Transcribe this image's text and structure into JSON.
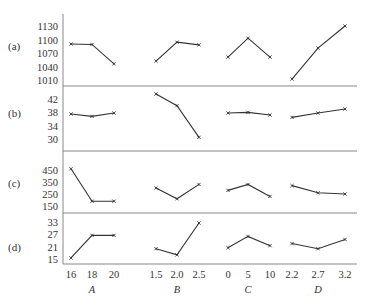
{
  "chart_data": {
    "type": "line",
    "title": "",
    "layout": {
      "panels_stacked_vertically": 4,
      "factor_groups_per_panel": 4,
      "grid": false,
      "legend": "none",
      "marker": "x-cross",
      "line_color": "#333333",
      "axis_color": "#888888"
    },
    "factors": [
      {
        "name": "A",
        "levels": [
          "16",
          "18",
          "20"
        ]
      },
      {
        "name": "B",
        "levels": [
          "1.5",
          "2.0",
          "2.5"
        ]
      },
      {
        "name": "C",
        "levels": [
          "0",
          "5",
          "10"
        ]
      },
      {
        "name": "D",
        "levels": [
          "2.2",
          "2.7",
          "3.2"
        ]
      }
    ],
    "panels": [
      {
        "label": "(a)",
        "yticks": [
          "1130",
          "1100",
          "1070",
          "1040",
          "1010"
        ],
        "ylim": [
          995,
          1145
        ],
        "series": [
          {
            "factor": "A",
            "values": [
              1090,
              1089,
              1046
            ]
          },
          {
            "factor": "B",
            "values": [
              1052,
              1094,
              1088
            ]
          },
          {
            "factor": "C",
            "values": [
              1061,
              1103,
              1061
            ]
          },
          {
            "factor": "D",
            "values": [
              1012,
              1081,
              1130
            ]
          }
        ]
      },
      {
        "label": "(b)",
        "yticks": [
          "42",
          "38",
          "34",
          "30"
        ],
        "ylim": [
          26.5,
          46
        ],
        "series": [
          {
            "factor": "A",
            "values": [
              37.5,
              36.8,
              37.8
            ]
          },
          {
            "factor": "B",
            "values": [
              43.5,
              40.0,
              30.5
            ]
          },
          {
            "factor": "C",
            "values": [
              37.8,
              38.0,
              37.2
            ]
          },
          {
            "factor": "D",
            "values": [
              36.5,
              37.8,
              39.0
            ]
          }
        ]
      },
      {
        "label": "(c)",
        "yticks": [
          "450",
          "350",
          "250",
          "150"
        ],
        "ylim": [
          95,
          580
        ],
        "series": [
          {
            "factor": "A",
            "values": [
              460,
              190,
              190
            ]
          },
          {
            "factor": "B",
            "values": [
              300,
              210,
              330
            ]
          },
          {
            "factor": "C",
            "values": [
              280,
              330,
              230
            ]
          },
          {
            "factor": "D",
            "values": [
              320,
              260,
              250
            ]
          }
        ]
      },
      {
        "label": "(d)",
        "yticks": [
          "33",
          "27",
          "21",
          "15"
        ],
        "ylim": [
          12.5,
          37
        ],
        "series": [
          {
            "factor": "A",
            "values": [
              15.5,
              26.5,
              26.5
            ]
          },
          {
            "factor": "B",
            "values": [
              20,
              17,
              32.5
            ]
          },
          {
            "factor": "C",
            "values": [
              20.5,
              26,
              21.5
            ]
          },
          {
            "factor": "D",
            "values": [
              22.5,
              20,
              24.5
            ]
          }
        ]
      }
    ]
  }
}
